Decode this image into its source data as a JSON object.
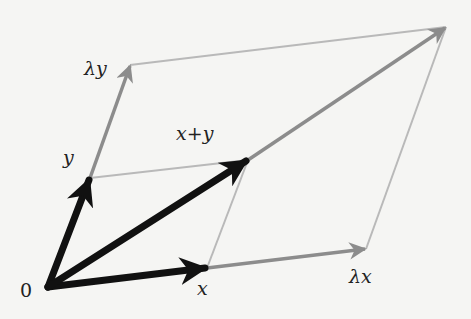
{
  "diagram": {
    "title": "",
    "colors": {
      "background": "#f5f5f3",
      "primary_vector": "#111111",
      "scaled_vector": "#8c8c8c",
      "guide_line": "#b9b9b9",
      "text": "#222222"
    },
    "points": {
      "origin": [
        48,
        287
      ],
      "x": [
        207,
        268
      ],
      "y": [
        90,
        178
      ],
      "x_plus_y": [
        248,
        160
      ],
      "lambda_x": [
        366,
        249
      ],
      "lambda_y": [
        130,
        65
      ],
      "lambda_x_plus_y": [
        446,
        27
      ]
    },
    "labels": {
      "origin": "0",
      "x": "x",
      "y": "y",
      "x_plus_y": "x+y",
      "lambda_x": "λx",
      "lambda_y": "λy"
    }
  }
}
